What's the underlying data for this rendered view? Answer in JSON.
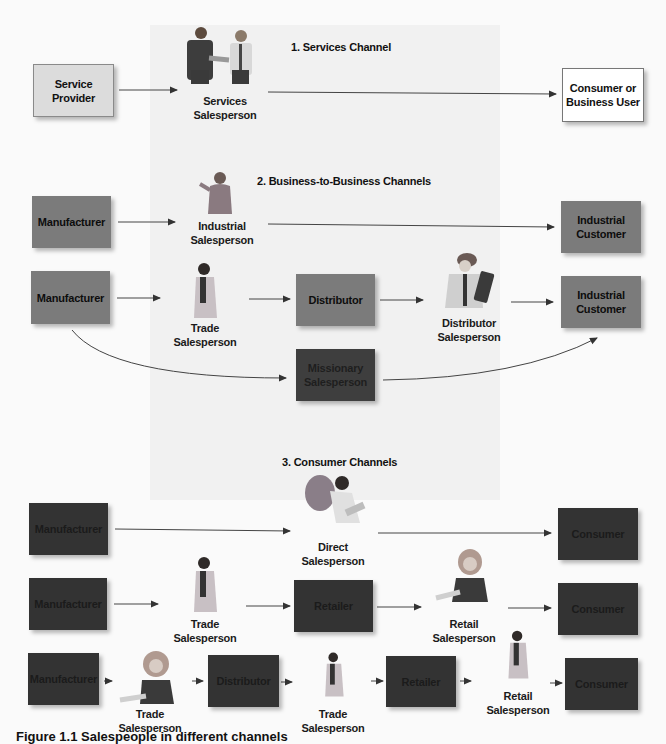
{
  "sections": {
    "services": {
      "heading": "1. Services Channel"
    },
    "b2b": {
      "heading": "2. Business-to-Business Channels"
    },
    "consumer": {
      "heading": "3. Consumer Channels"
    }
  },
  "nodes": {
    "service_provider": [
      "Service",
      "Provider"
    ],
    "services_salesperson": [
      "Services",
      "Salesperson"
    ],
    "consumer_business_user": [
      "Consumer or",
      "Business User"
    ],
    "b2b_manufacturer_1": "Manufacturer",
    "industrial_salesperson": [
      "Industrial",
      "Salesperson"
    ],
    "industrial_customer_1": [
      "Industrial",
      "Customer"
    ],
    "b2b_manufacturer_2": "Manufacturer",
    "b2b_trade_salesperson": [
      "Trade",
      "Salesperson"
    ],
    "b2b_distributor": "Distributor",
    "distributor_salesperson": [
      "Distributor",
      "Salesperson"
    ],
    "industrial_customer_2": [
      "Industrial",
      "Customer"
    ],
    "missionary_salesperson": [
      "Missionary",
      "Salesperson"
    ],
    "c_manufacturer_1": "Manufacturer",
    "direct_salesperson": [
      "Direct",
      "Salesperson"
    ],
    "consumer_1": "Consumer",
    "c_manufacturer_2": "Manufacturer",
    "c_trade_salesperson_1": [
      "Trade",
      "Salesperson"
    ],
    "retailer_1": "Retailer",
    "retail_salesperson_1": [
      "Retail",
      "Salesperson"
    ],
    "consumer_2": "Consumer",
    "c_manufacturer_3": "Manufacturer",
    "c_trade_salesperson_2": [
      "Trade",
      "Salesperson"
    ],
    "c_distributor": "Distributor",
    "c_trade_salesperson_3": [
      "Trade",
      "Salesperson"
    ],
    "retailer_2": "Retailer",
    "retail_salesperson_2": [
      "Retail",
      "Salesperson"
    ],
    "consumer_3": "Consumer"
  },
  "caption": "Figure 1.1 Salespeople in different channels",
  "colors": {
    "background": "#fafafa",
    "panel": "#f1f1f1",
    "services_box": "#dcdcdc",
    "b2b_box": "#7b7b7b",
    "missionary_box": "#3e3e3e",
    "consumer_box": "#333333",
    "arrow": "#333333"
  }
}
